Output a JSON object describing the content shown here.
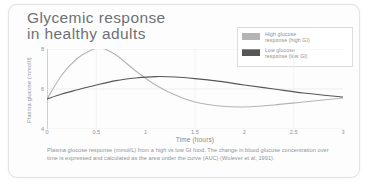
{
  "chart_data": {
    "type": "line",
    "title": "Glycemic response\nin healthy adults",
    "xlabel": "Time (hours)",
    "ylabel": "Plasma glucose (mmol/l)",
    "xlim": [
      0,
      3
    ],
    "ylim": [
      4,
      8
    ],
    "xticks": [
      "0",
      "0.5",
      "1",
      "1.5",
      "2",
      "2.5",
      "3"
    ],
    "xtick_values": [
      0,
      0.5,
      1,
      1.5,
      2,
      2.5,
      3
    ],
    "yticks": [
      "8",
      "6",
      "4"
    ],
    "ytick_values": [
      8,
      6,
      4
    ],
    "grid": true,
    "legend_position": "top-right",
    "series": [
      {
        "name": "High glucose\nresponse (high GI)",
        "color": "#b4b4b4",
        "x": [
          0,
          0.15,
          0.3,
          0.45,
          0.55,
          0.7,
          0.9,
          1.1,
          1.3,
          1.5,
          1.75,
          2.0,
          2.3,
          2.6,
          3.0
        ],
        "values": [
          5.5,
          6.7,
          7.5,
          7.95,
          8.05,
          7.7,
          6.9,
          6.2,
          5.7,
          5.35,
          5.15,
          5.1,
          5.2,
          5.35,
          5.55
        ]
      },
      {
        "name": "Low glucose\nresponse (low GI)",
        "color": "#565656",
        "x": [
          0,
          0.15,
          0.3,
          0.5,
          0.7,
          0.9,
          1.1,
          1.3,
          1.5,
          1.75,
          2.0,
          2.3,
          2.6,
          3.0
        ],
        "values": [
          5.5,
          5.75,
          5.95,
          6.2,
          6.42,
          6.55,
          6.62,
          6.6,
          6.52,
          6.38,
          6.2,
          6.0,
          5.8,
          5.6
        ]
      }
    ]
  },
  "legend": {
    "items": [
      {
        "label": "High glucose\nresponse (high GI)",
        "color": "#b4b4b4"
      },
      {
        "label": "Low glucose\nresponse (low GI)",
        "color": "#565656"
      }
    ]
  },
  "caption": {
    "text": "Plasma glucose response (mmol/L) from a high vs low GI food. The change in blood glucose concentration over time is expressed and calculated as the area under the curve (AUC) (Wolever et al, 1991)."
  },
  "colors": {
    "high_gi": "#b4b4b4",
    "low_gi": "#565656",
    "grid": "#e7e7e7",
    "axis": "#c9c9c9",
    "text": "#8c9196"
  }
}
